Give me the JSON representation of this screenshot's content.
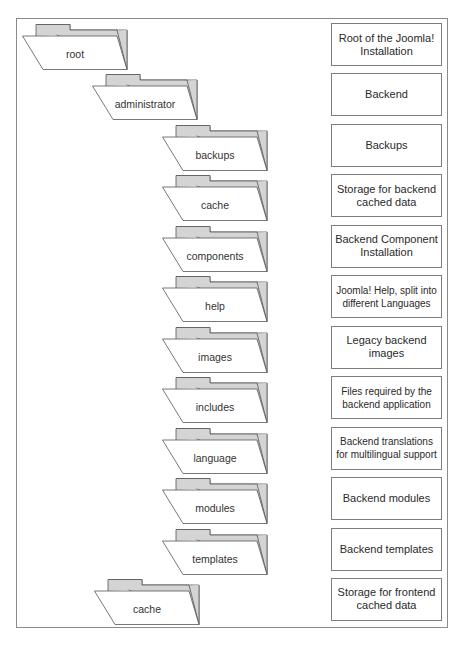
{
  "diagram": {
    "rows": [
      {
        "folder": "root",
        "level": "root",
        "description": "Root of the Joomla! Installation"
      },
      {
        "folder": "administrator",
        "level": "admin",
        "description": "Backend"
      },
      {
        "folder": "backups",
        "level": "sub",
        "description": "Backups"
      },
      {
        "folder": "cache",
        "level": "sub",
        "description": "Storage for backend cached data"
      },
      {
        "folder": "components",
        "level": "sub",
        "description": "Backend Component Installation"
      },
      {
        "folder": "help",
        "level": "sub",
        "description": "Joomla! Help, split into different Languages"
      },
      {
        "folder": "images",
        "level": "sub",
        "description": "Legacy backend images"
      },
      {
        "folder": "includes",
        "level": "sub",
        "description": "Files required by the backend application"
      },
      {
        "folder": "language",
        "level": "sub",
        "description": "Backend translations for multilingual support"
      },
      {
        "folder": "modules",
        "level": "sub",
        "description": "Backend modules"
      },
      {
        "folder": "templates",
        "level": "sub",
        "description": "Backend templates"
      },
      {
        "folder": "cache",
        "level": "frontend",
        "description": "Storage for frontend cached data"
      }
    ],
    "colors": {
      "folder_tab": "#d4d4d4",
      "folder_front": "#ffffff",
      "outline": "#555555",
      "frame": "#8a8a8a"
    }
  }
}
